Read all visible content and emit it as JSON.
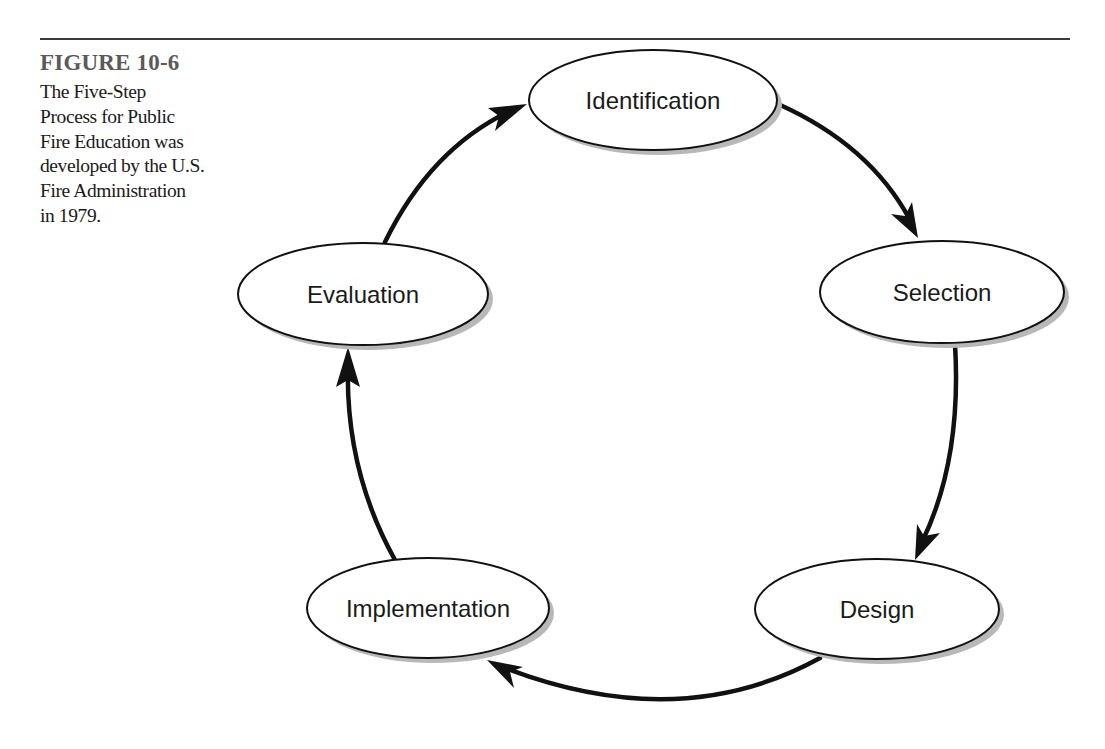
{
  "caption": {
    "heading": "FIGURE 10-6",
    "lines": [
      "The Five-Step",
      "Process for Public",
      "Fire Education was",
      "developed by the U.S.",
      "Fire Administration",
      "in 1979."
    ]
  },
  "diagram": {
    "type": "cycle",
    "title": "The Five-Step Process for Public Fire Education",
    "nodes": [
      {
        "id": "identification",
        "label": "Identification"
      },
      {
        "id": "selection",
        "label": "Selection"
      },
      {
        "id": "design",
        "label": "Design"
      },
      {
        "id": "implementation",
        "label": "Implementation"
      },
      {
        "id": "evaluation",
        "label": "Evaluation"
      }
    ],
    "edges": [
      {
        "from": "identification",
        "to": "selection"
      },
      {
        "from": "selection",
        "to": "design"
      },
      {
        "from": "design",
        "to": "implementation"
      },
      {
        "from": "implementation",
        "to": "evaluation"
      },
      {
        "from": "evaluation",
        "to": "identification"
      }
    ]
  },
  "colors": {
    "stroke": "#111111",
    "shadow": "#b8b8b8",
    "heading": "#5a5a5a",
    "text": "#1a1a1a",
    "rule": "#3a3a3a"
  }
}
